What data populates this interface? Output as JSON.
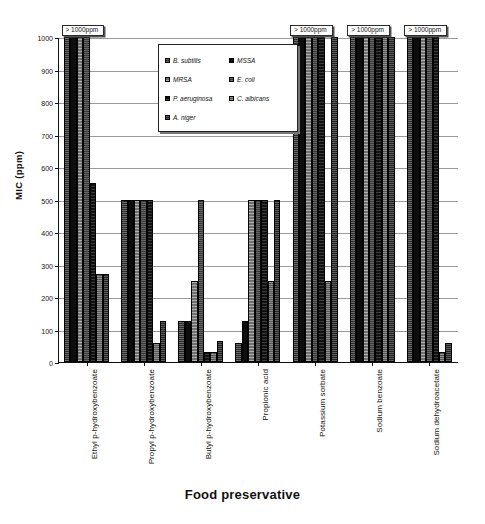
{
  "chart_data": {
    "type": "bar",
    "title": "",
    "xlabel": "Food preservative",
    "ylabel": "MIC (ppm)",
    "ylim": [
      0,
      1000
    ],
    "ytick_step": 100,
    "yticks": [
      0,
      100,
      200,
      300,
      400,
      500,
      600,
      700,
      800,
      900,
      1000
    ],
    "grid": true,
    "legend_position": "inside-top-center",
    "categories": [
      "Ethyl p-hydroxybenzoate",
      "Propyl p-hydroxybenzoate",
      "Butyl p-hydroxybenzoate",
      "Propionic acid",
      "Potassium sorbate",
      "Sodium benzoate",
      "Sodium dehydroacetate"
    ],
    "series": [
      {
        "name": "B. subtilis",
        "values": [
          1000,
          500,
          125,
          60,
          1000,
          1000,
          1000
        ]
      },
      {
        "name": "MSSA",
        "values": [
          1000,
          500,
          125,
          125,
          1000,
          1000,
          1000
        ]
      },
      {
        "name": "MRSA",
        "values": [
          1000,
          500,
          250,
          500,
          1000,
          1000,
          1000
        ]
      },
      {
        "name": "E. coli",
        "values": [
          1000,
          500,
          500,
          500,
          1000,
          1000,
          1000
        ]
      },
      {
        "name": "P. aeruginosa",
        "values": [
          550,
          500,
          30,
          500,
          1000,
          1000,
          1000
        ]
      },
      {
        "name": "C. albicans",
        "values": [
          270,
          60,
          30,
          250,
          250,
          1000,
          30
        ]
      },
      {
        "name": "A. niger",
        "values": [
          270,
          125,
          65,
          500,
          1000,
          1000,
          60
        ]
      }
    ],
    "annotations": [
      {
        "text": "> 1000ppm",
        "category": "Ethyl p-hydroxybenzoate"
      },
      {
        "text": "> 1000ppm",
        "category": "Potassium sorbate"
      },
      {
        "text": "> 1000ppm",
        "category": "Sodium benzoate"
      },
      {
        "text": "> 1000ppm",
        "category": "Sodium dehydroacetate"
      }
    ]
  }
}
